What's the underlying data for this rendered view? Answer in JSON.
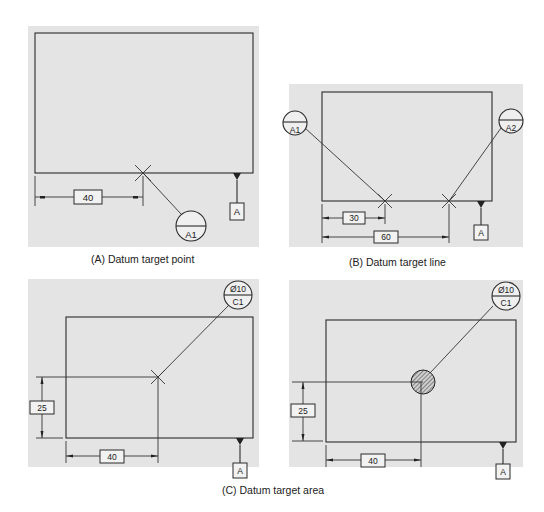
{
  "figure": {
    "panels": [
      {
        "id": "A",
        "caption": "(A) Datum target point",
        "dimension": "40",
        "target_label": "A1",
        "datum_label": "A"
      },
      {
        "id": "B",
        "caption": "(B) Datum target line",
        "dimensions": [
          "30",
          "60"
        ],
        "target_labels": [
          "A1",
          "A2"
        ],
        "datum_label": "A"
      },
      {
        "id": "C",
        "dimensions": [
          "25",
          "40"
        ],
        "target_size": "Ø10",
        "target_label": "C1",
        "datum_label": "A"
      },
      {
        "id": "D",
        "dimensions": [
          "25",
          "40"
        ],
        "target_size": "Ø10",
        "target_label": "C1",
        "datum_label": "A"
      }
    ],
    "shared_caption": "(C) Datum target area"
  }
}
